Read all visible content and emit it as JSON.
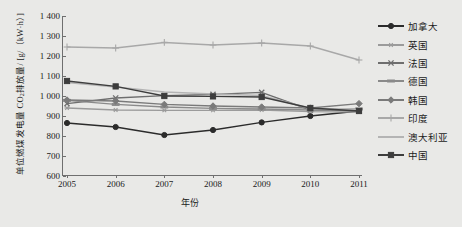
{
  "chart_data": {
    "type": "line",
    "title": "",
    "xlabel": "年份",
    "ylabel": "单位燃煤发电量 CO2排放量/ [g/（kW·h）]",
    "ylabel_prefix": "单位燃煤发电量 CO",
    "ylabel_subscript": "2",
    "ylabel_suffix": "排放量/ [g/（kW·h）]",
    "categories": [
      "2005",
      "2006",
      "2007",
      "2008",
      "2009",
      "2010",
      "2011"
    ],
    "x": [
      2005,
      2006,
      2007,
      2008,
      2009,
      2010,
      2011
    ],
    "ylim": [
      600,
      1400
    ],
    "xlim": [
      2005,
      2011
    ],
    "yticks": [
      "600",
      "700",
      "800",
      "900",
      "1 000",
      "1 100",
      "1 200",
      "1 300",
      "1 400"
    ],
    "ytick_values": [
      600,
      700,
      800,
      900,
      1000,
      1100,
      1200,
      1300,
      1400
    ],
    "grid": false,
    "legend_position": "right",
    "series": [
      {
        "name": "加拿大",
        "color": "#2b2b2b",
        "marker": "circle",
        "values": [
          865,
          845,
          805,
          830,
          868,
          900,
          925
        ]
      },
      {
        "name": "英国",
        "color": "#9b9b9b",
        "marker": "star",
        "values": [
          940,
          930,
          928,
          928,
          930,
          922,
          920
        ]
      },
      {
        "name": "法国",
        "color": "#6e6e6e",
        "marker": "cross",
        "values": [
          962,
          990,
          1002,
          1008,
          1018,
          930,
          928
        ]
      },
      {
        "name": "德国",
        "color": "#8a8a8a",
        "marker": "dash",
        "values": [
          978,
          958,
          945,
          938,
          935,
          930,
          935
        ]
      },
      {
        "name": "韩国",
        "color": "#7a7a7a",
        "marker": "diamond",
        "values": [
          980,
          975,
          958,
          950,
          945,
          940,
          962
        ]
      },
      {
        "name": "印度",
        "color": "#a8a8a8",
        "marker": "plus",
        "values": [
          1245,
          1240,
          1268,
          1255,
          1265,
          1250,
          1180
        ]
      },
      {
        "name": "澳大利亚",
        "color": "#b4b4b4",
        "marker": "none",
        "values": [
          1068,
          1045,
          1020,
          1010,
          1002,
          938,
          932
        ]
      },
      {
        "name": "中国",
        "color": "#3d3d3d",
        "marker": "square",
        "values": [
          1075,
          1048,
          1000,
          998,
          995,
          940,
          925
        ]
      }
    ]
  }
}
